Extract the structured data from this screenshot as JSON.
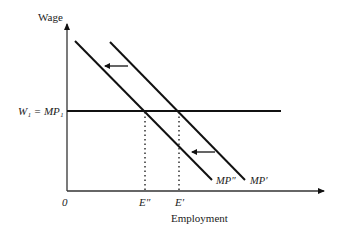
{
  "diagram": {
    "type": "economics-labor-market",
    "y_axis_label": "Wage",
    "x_axis_label": "Employment",
    "origin_label": "0",
    "wage_line_label": "W₁ = MP₁",
    "curves": [
      {
        "name": "MP″",
        "label": "MP″",
        "from": [
          75,
          41
        ],
        "to": [
          212,
          180
        ]
      },
      {
        "name": "MP′",
        "label": "MP′",
        "from": [
          110,
          42
        ],
        "to": [
          245,
          180
        ]
      }
    ],
    "employment_points": [
      {
        "label": "E″",
        "x": 145
      },
      {
        "label": "E′",
        "x": 179
      }
    ],
    "shift_arrows": [
      {
        "direction": "left",
        "from": [
          128,
          66
        ],
        "to": [
          104,
          66
        ]
      },
      {
        "direction": "left",
        "from": [
          215,
          152
        ],
        "to": [
          191,
          152
        ]
      }
    ],
    "colors": {
      "ink": "#111111",
      "background": "#ffffff"
    }
  }
}
